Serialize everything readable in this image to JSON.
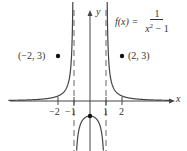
{
  "chart_data": {
    "type": "line",
    "title": "",
    "function_label": "f(x) =",
    "function_expr": "1 / (x^2 - 1)",
    "formula": {
      "lhs": "f(x) =",
      "numerator": "1",
      "denominator_base": "x",
      "denominator_exp": "2",
      "denominator_rest": " − 1"
    },
    "xlabel": "x",
    "ylabel": "y",
    "x_ticks": [
      {
        "value": -2,
        "label": "−2"
      },
      {
        "value": -1,
        "label": "−1"
      },
      {
        "value": 1,
        "label": "1"
      },
      {
        "value": 2,
        "label": "2"
      }
    ],
    "asymptotes": {
      "vertical": [
        -1,
        1
      ],
      "horizontal": [
        0
      ],
      "style": "dashed"
    },
    "points": [
      {
        "x": -2,
        "y": 3,
        "label": "(−2, 3)"
      },
      {
        "x": 2,
        "y": 3,
        "label": "(2, 3)"
      },
      {
        "x": 0,
        "y": -1,
        "label": ""
      }
    ],
    "xlim": [
      -5.6,
      5.9
    ],
    "ylim": [
      -3.3,
      6.7
    ],
    "grid": false,
    "legend": "none"
  }
}
